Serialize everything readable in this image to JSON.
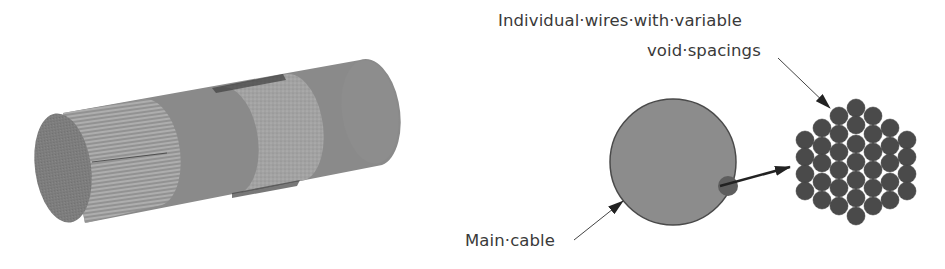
{
  "figure": {
    "left_panel": {
      "description": "3D cable model with hatched wire-strand section and textured band",
      "colors": {
        "body": "#8a8a8a",
        "end_cap": "#7c7c7c",
        "hatch_band": "#9a9a9a",
        "texture_band": "#a3a3a3",
        "edge_dark": "#3e3e3e"
      }
    },
    "right_panel": {
      "labels": {
        "wires_line1": "Individual·wires·with·variable",
        "wires_line2": "void·spacings",
        "main_cable": "Main·cable"
      },
      "colors": {
        "main_cable_fill": "#8c8c8c",
        "main_cable_stroke": "#4a4a4a",
        "highlight_fill": "#5e5e5e",
        "wire_fill": "#4a4a4a",
        "arrow": "#222222"
      },
      "wire_count": 44
    }
  }
}
